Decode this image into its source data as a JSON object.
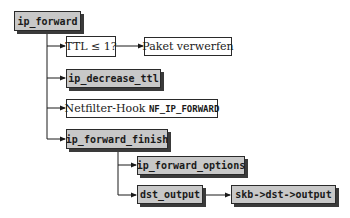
{
  "diagram": {
    "root": {
      "label": "ip_forward",
      "kind": "function"
    },
    "steps": [
      {
        "id": "ttl_check",
        "label": "TTL ≤ 1?",
        "kind": "condition",
        "then": {
          "label": "Paket verwerfen",
          "kind": "text"
        }
      },
      {
        "id": "decrease_ttl",
        "label": "ip_decrease_ttl",
        "kind": "function"
      },
      {
        "id": "netfilter",
        "label_prefix": "Netfilter-Hook ",
        "label_code": "NF_IP_FORWARD",
        "kind": "text"
      },
      {
        "id": "forward_finish",
        "label": "ip_forward_finish",
        "kind": "function",
        "children": [
          {
            "id": "forward_options",
            "label": "ip_forward_options",
            "kind": "function"
          },
          {
            "id": "dst_output",
            "label": "dst_output",
            "kind": "function",
            "then": {
              "label": "skb->dst->output",
              "kind": "function"
            }
          }
        ]
      }
    ]
  },
  "colors": {
    "function_fill": "#c8c8c8",
    "text_fill": "#ffffff",
    "border": "#2a2a2a",
    "shadow": "#3a3a3a",
    "line": "#1a1a1a"
  }
}
